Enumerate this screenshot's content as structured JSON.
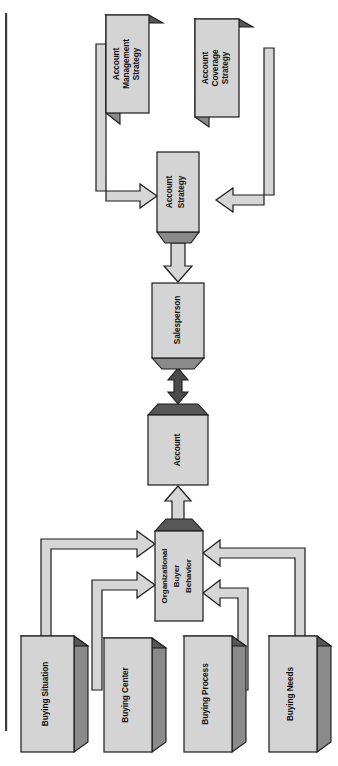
{
  "diagram": {
    "orientation": "rotated-90-ccw",
    "page_rule": {
      "name": "left-margin-rule",
      "color": "#3d3d3d"
    },
    "nodes": [
      {
        "id": "account-management-strategy",
        "label_lines": [
          "Account",
          "Management",
          "Strategy"
        ],
        "style": "block-3d"
      },
      {
        "id": "account-coverage-strategy",
        "label_lines": [
          "Account",
          "Coverage",
          "Strategy"
        ],
        "style": "block-3d"
      },
      {
        "id": "account-strategy",
        "label_lines": [
          "Account",
          "Strategy"
        ],
        "style": "flat"
      },
      {
        "id": "salesperson",
        "label_lines": [
          "Salesperson"
        ],
        "style": "flat"
      },
      {
        "id": "account",
        "label_lines": [
          "Account"
        ],
        "style": "flat"
      },
      {
        "id": "organizational-buyer-behavior",
        "label_lines": [
          "Organizational",
          "Buyer",
          "Behavior"
        ],
        "style": "block-3d"
      },
      {
        "id": "buying-situation",
        "label_lines": [
          "Buying Situation"
        ],
        "style": "block-3d"
      },
      {
        "id": "buying-center",
        "label_lines": [
          "Buying Center"
        ],
        "style": "block-3d"
      },
      {
        "id": "buying-process",
        "label_lines": [
          "Buying Process"
        ],
        "style": "block-3d"
      },
      {
        "id": "buying-needs",
        "label_lines": [
          "Buying Needs"
        ],
        "style": "block-3d"
      }
    ],
    "edges": [
      {
        "from": "account-management-strategy",
        "to": "account-strategy",
        "kind": "hollow-arrow"
      },
      {
        "from": "account-coverage-strategy",
        "to": "account-strategy",
        "kind": "hollow-arrow"
      },
      {
        "from": "account-strategy",
        "to": "salesperson",
        "kind": "hollow-arrow"
      },
      {
        "from": "salesperson",
        "to": "account",
        "kind": "solid-double-arrow"
      },
      {
        "from": "organizational-buyer-behavior",
        "to": "account",
        "kind": "hollow-arrow"
      },
      {
        "from": "buying-situation",
        "to": "organizational-buyer-behavior",
        "kind": "hollow-arrow"
      },
      {
        "from": "buying-center",
        "to": "organizational-buyer-behavior",
        "kind": "hollow-arrow"
      },
      {
        "from": "buying-process",
        "to": "organizational-buyer-behavior",
        "kind": "hollow-arrow"
      },
      {
        "from": "buying-needs",
        "to": "organizational-buyer-behavior",
        "kind": "hollow-arrow"
      }
    ],
    "colors": {
      "face": "#d4d4d4",
      "top": "#575757",
      "side": "#8a8a8a",
      "outline": "#1a1a1a",
      "solid_arrow": "#4a4a4a",
      "background": "#ffffff"
    }
  }
}
